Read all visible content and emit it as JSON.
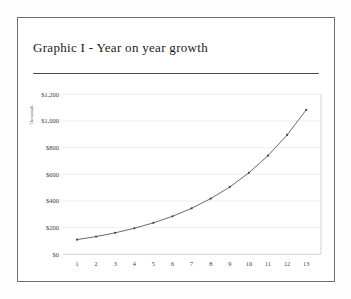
{
  "card": {
    "title": "Graphic I - Year on year growth"
  },
  "chart_data": {
    "type": "line",
    "title": "Graphic I - Year on year growth",
    "ylabel": "Thousands",
    "xlabel": "",
    "x": [
      1,
      2,
      3,
      4,
      5,
      6,
      7,
      8,
      9,
      10,
      11,
      12,
      13
    ],
    "values": [
      110,
      133,
      161,
      195,
      236,
      285,
      345,
      418,
      505,
      611,
      740,
      895,
      1083
    ],
    "series_name": "Year on year growth",
    "y_ticks": [
      {
        "label": "$1,200",
        "value": 1200
      },
      {
        "label": "$1,000",
        "value": 1000
      },
      {
        "label": "$800",
        "value": 800
      },
      {
        "label": "$600",
        "value": 600
      },
      {
        "label": "$400",
        "value": 400
      },
      {
        "label": "$200",
        "value": 200
      },
      {
        "label": "$0",
        "value": 0
      }
    ],
    "ylim": [
      0,
      1200
    ],
    "grid": true,
    "legend": false,
    "colors": {
      "line": "#595959",
      "marker": "#444444",
      "grid": "#e6e6e6",
      "axis": "#c9c9c9",
      "plot_border": "#c9c9c9",
      "tick_text": "#3c3c3c",
      "axis_label_text": "#6a6a6a"
    }
  }
}
